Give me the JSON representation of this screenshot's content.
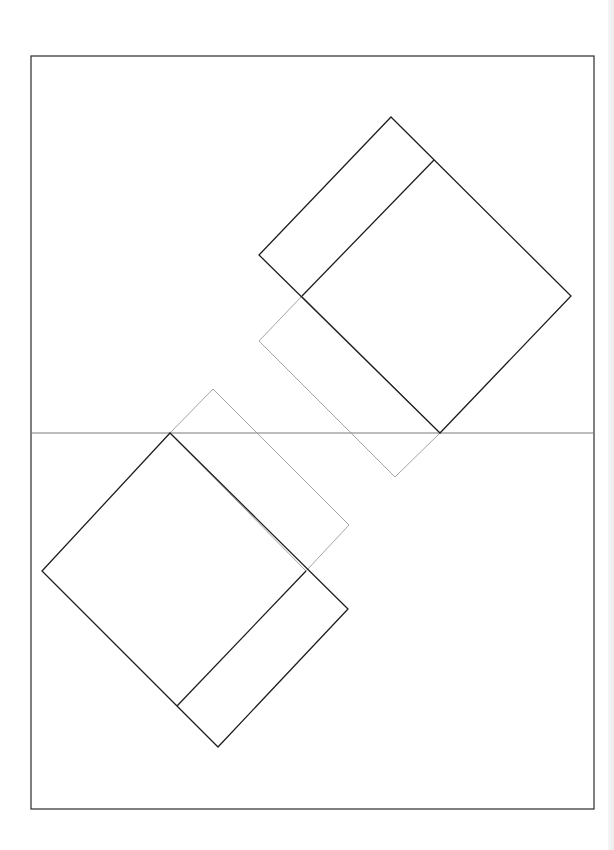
{
  "canvas": {
    "width": 614,
    "height": 850,
    "background": "#ffffff"
  },
  "colors": {
    "frame": "#2a2a2a",
    "midline": "#7a7a7a",
    "dark_line": "#1e1e1e",
    "ghost_line": "#9a9a9a"
  },
  "frame": {
    "x": 31,
    "y": 56,
    "width": 563,
    "height": 753
  },
  "midline": {
    "x1": 31,
    "y1": 433,
    "x2": 594,
    "y2": 433
  },
  "shapes": {
    "upper_square": {
      "points": "391,117 571,296 440,433 259,255",
      "divider": {
        "x1": 434,
        "y1": 160,
        "x2": 302,
        "y2": 296
      }
    },
    "upper_ghost_rect": {
      "points": "302,296 259,341 395,477 440,433"
    },
    "lower_square": {
      "points": "170,433 42,571 218,747 348,609",
      "divider": {
        "x1": 306,
        "y1": 571,
        "x2": 177,
        "y2": 706
      }
    },
    "lower_ghost_rect": {
      "points": "170,433 213,389 349,525 306,571"
    }
  }
}
